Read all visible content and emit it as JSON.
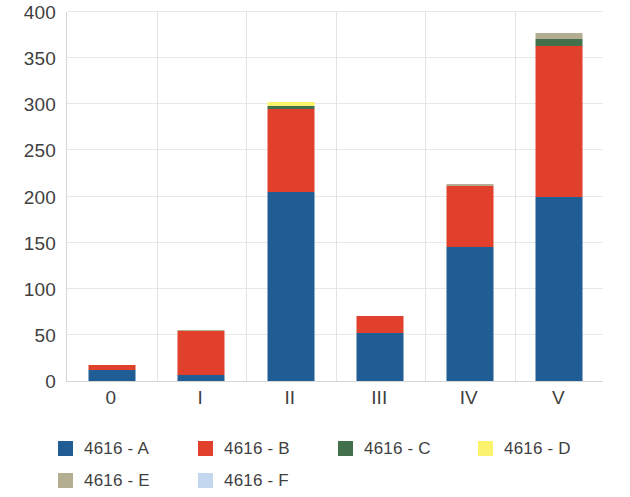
{
  "chart_data": {
    "type": "bar",
    "subtype": "stacked-column",
    "title": "",
    "xlabel": "",
    "ylabel": "",
    "categories": [
      "0",
      "I",
      "II",
      "III",
      "IV",
      "V"
    ],
    "ylim": [
      0,
      400
    ],
    "y_ticks": [
      0,
      50,
      100,
      150,
      200,
      250,
      300,
      350,
      400
    ],
    "y_tick_labels": [
      "0",
      "50",
      "100",
      "150",
      "200",
      "250",
      "300",
      "350",
      "400"
    ],
    "grid": true,
    "grid_axis": "y",
    "legend_position": "bottom",
    "series": [
      {
        "name": "4616 - A",
        "color": "#1f5d94",
        "values": [
          12,
          7,
          205,
          52,
          145,
          200
        ]
      },
      {
        "name": "4616 - B",
        "color": "#e0402c",
        "values": [
          5,
          47,
          90,
          19,
          66,
          163
        ]
      },
      {
        "name": "4616 - C",
        "color": "#41704b",
        "values": [
          0,
          0,
          3,
          0,
          0,
          8
        ]
      },
      {
        "name": "4616 - D",
        "color": "#fbf26e",
        "values": [
          0,
          0,
          5,
          0,
          0,
          0
        ]
      },
      {
        "name": "4616 - E",
        "color": "#b3ad92",
        "values": [
          0,
          1,
          0,
          0,
          3,
          6
        ]
      },
      {
        "name": "4616 - F",
        "color": "#c3d8ee",
        "values": [
          0,
          0,
          0,
          0,
          0,
          0
        ]
      }
    ],
    "totals": [
      17,
      55,
      303,
      71,
      214,
      377
    ],
    "colors": {
      "axis": "#d6d6d6",
      "gridline": "#e8e8e8",
      "text": "#3f3f3f",
      "background": "#ffffff"
    }
  },
  "legend": {
    "rows": [
      [
        {
          "label": "4616 - A",
          "color": "#1f5d94"
        },
        {
          "label": "4616 - B",
          "color": "#e0402c"
        },
        {
          "label": "4616 - C",
          "color": "#41704b"
        },
        {
          "label": "4616 - D",
          "color": "#fbf26e"
        }
      ],
      [
        {
          "label": "4616 - E",
          "color": "#b3ad92"
        },
        {
          "label": "4616 - F",
          "color": "#c3d8ee"
        }
      ]
    ]
  }
}
